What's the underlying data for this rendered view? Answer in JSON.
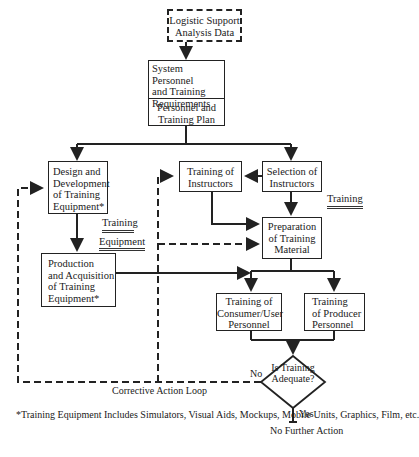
{
  "diagram": {
    "boxes": {
      "lsa_data": {
        "lines": [
          "Logistic Support",
          "Analysis Data"
        ]
      },
      "system_personnel": {
        "lines": [
          "System Personnel",
          "and Training",
          "Requirements"
        ]
      },
      "personnel_plan": {
        "lines": [
          "Personnel and",
          "Training Plan"
        ]
      },
      "design_equipment": {
        "lines": [
          "Design and",
          "Development",
          "of Training",
          "Equipment*"
        ]
      },
      "training_instructors": {
        "lines": [
          "Training of",
          "Instructors"
        ]
      },
      "selection_instructors": {
        "lines": [
          "Selection of",
          "Instructors"
        ]
      },
      "preparation_material": {
        "lines": [
          "Preparation",
          "of Training",
          "Material"
        ]
      },
      "production_equipment": {
        "lines": [
          "Production",
          "and Acquisition",
          "of Training",
          "Equipment*"
        ]
      },
      "consumer_training": {
        "lines": [
          "Training of",
          "Consumer/User",
          "Personnel"
        ]
      },
      "producer_training": {
        "lines": [
          "Training",
          "of Producer",
          "Personnel"
        ]
      }
    },
    "decision": {
      "lines": [
        "Is",
        "Training",
        "Adequate?"
      ],
      "no_label": "No",
      "yes_label": "Yes"
    },
    "section_labels": {
      "training_equipment_1": "Training",
      "training_equipment_2": "Equipment",
      "training": "Training"
    },
    "loop_label": "Corrective Action Loop",
    "end_label": {
      "lines": [
        "No Further",
        "Action"
      ]
    },
    "footnote": {
      "lines": [
        "*Training Equipment Includes Simulators, Visual Aids, Mockups,",
        "Mobile Units, Graphics, Film, etc."
      ]
    }
  }
}
